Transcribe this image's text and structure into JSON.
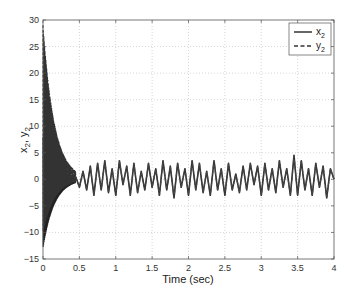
{
  "chart_data": {
    "type": "line",
    "title": "",
    "xlabel": "Time (sec)",
    "ylabel": "x2, y2",
    "ylabel_parts": {
      "a": "x",
      "a_sub": "2",
      "sep": ", ",
      "b": "y",
      "b_sub": "2"
    },
    "xlim": [
      0,
      4
    ],
    "ylim": [
      -15,
      30
    ],
    "grid": true,
    "legend_position": "upper right",
    "x_ticks": [
      0,
      0.5,
      1,
      1.5,
      2,
      2.5,
      3,
      3.5,
      4
    ],
    "x_tick_labels": [
      "0",
      "0.5",
      "1",
      "1.5",
      "2",
      "2.5",
      "3",
      "3.5",
      "4"
    ],
    "y_ticks": [
      -15,
      -10,
      -5,
      0,
      5,
      10,
      15,
      20,
      25,
      30
    ],
    "y_tick_labels": [
      "−15",
      "−10",
      "−5",
      "0",
      "5",
      "10",
      "15",
      "20",
      "25",
      "30"
    ],
    "series": [
      {
        "name": "x2",
        "label_main": "x",
        "label_sub": "2",
        "style": "solid",
        "color": "#333333",
        "description": "Oscillating transient decaying from about +8/-13 at t=0, converging by ~0.45 s to a chaotic signal bounded roughly within [-3.5, 4.5]",
        "initial_envelope": {
          "max": 8,
          "min": -13
        }
      },
      {
        "name": "y2",
        "label_main": "y",
        "label_sub": "2",
        "style": "dashed",
        "color": "#333333",
        "description": "Oscillating transient decaying from about +30/-10 at t=0, synchronizing with x2 by ~0.45 s",
        "initial_envelope": {
          "max": 29,
          "min": -10
        }
      }
    ],
    "sync_time": 0.45,
    "steady_state_samples": {
      "t": [
        0.45,
        0.5,
        0.55,
        0.6,
        0.65,
        0.7,
        0.75,
        0.8,
        0.85,
        0.9,
        0.95,
        1.0,
        1.05,
        1.1,
        1.15,
        1.2,
        1.25,
        1.3,
        1.35,
        1.4,
        1.45,
        1.5,
        1.55,
        1.6,
        1.65,
        1.7,
        1.75,
        1.8,
        1.85,
        1.9,
        1.95,
        2.0,
        2.05,
        2.1,
        2.15,
        2.2,
        2.25,
        2.3,
        2.35,
        2.4,
        2.45,
        2.5,
        2.55,
        2.6,
        2.65,
        2.7,
        2.75,
        2.8,
        2.85,
        2.9,
        2.95,
        3.0,
        3.05,
        3.1,
        3.15,
        3.2,
        3.25,
        3.3,
        3.35,
        3.4,
        3.45,
        3.5,
        3.55,
        3.6,
        3.65,
        3.7,
        3.75,
        3.8,
        3.85,
        3.9,
        3.95,
        4.0
      ],
      "value": [
        0.5,
        -1.5,
        1.5,
        -2,
        2.5,
        -3,
        3,
        -2,
        3.5,
        -2.5,
        2,
        -3,
        3.5,
        -1,
        2.5,
        -3,
        3,
        -2.5,
        1.5,
        -2,
        3,
        -1.5,
        2,
        -3,
        3.5,
        -2,
        2.5,
        -3.5,
        3,
        -1.5,
        2,
        -3,
        3.5,
        -2,
        3,
        -2.5,
        1.5,
        -3,
        3.5,
        -2,
        2,
        -3,
        3,
        -2,
        1,
        -2.5,
        2.5,
        -2,
        3,
        -1,
        2.5,
        -3,
        3,
        -2,
        2,
        -2.5,
        3.5,
        -1.5,
        2,
        -3,
        4.5,
        -3,
        3.5,
        -2,
        2,
        -3,
        3,
        -1.5,
        2.5,
        -3.5,
        2,
        0
      ]
    }
  },
  "legend": {
    "items": [
      {
        "label": "x",
        "sub": "2",
        "style": "solid"
      },
      {
        "label": "y",
        "sub": "2",
        "style": "dashed"
      }
    ]
  }
}
